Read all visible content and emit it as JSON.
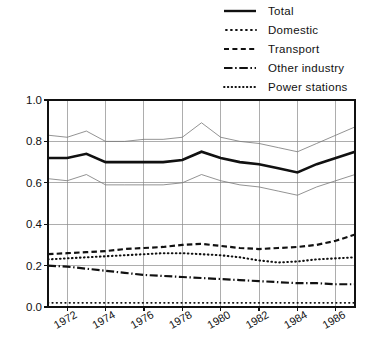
{
  "chart_data": {
    "type": "line",
    "title": "",
    "subtitle": "",
    "xlabel": "",
    "ylabel": "",
    "xlim": [
      1971,
      1987
    ],
    "ylim": [
      0.0,
      1.0
    ],
    "grid": true,
    "legend_position": "top-right",
    "x": [
      1971,
      1972,
      1973,
      1974,
      1975,
      1976,
      1977,
      1978,
      1979,
      1980,
      1981,
      1982,
      1983,
      1984,
      1985,
      1986,
      1987
    ],
    "y_ticks": [
      0.0,
      0.2,
      0.4,
      0.6,
      0.8,
      1.0
    ],
    "y_tick_labels": [
      "0.0",
      "0.2",
      "0.4",
      "0.6",
      "0.8",
      "1.0"
    ],
    "x_ticks": [
      1972,
      1974,
      1976,
      1978,
      1980,
      1982,
      1984,
      1986
    ],
    "x_tick_labels": [
      "1972",
      "1974",
      "1976",
      "1978",
      "1980",
      "1982",
      "1984",
      "1986"
    ],
    "series": [
      {
        "name": "Total",
        "style": "solid",
        "values": [
          0.72,
          0.72,
          0.74,
          0.7,
          0.7,
          0.7,
          0.7,
          0.71,
          0.75,
          0.72,
          0.7,
          0.69,
          0.67,
          0.65,
          0.69,
          0.72,
          0.75
        ]
      },
      {
        "name": "Total upper bound",
        "style": "thin-solid",
        "values": [
          0.83,
          0.82,
          0.85,
          0.8,
          0.8,
          0.81,
          0.81,
          0.82,
          0.89,
          0.82,
          0.8,
          0.79,
          0.77,
          0.75,
          0.79,
          0.83,
          0.87
        ]
      },
      {
        "name": "Total lower bound",
        "style": "thin-solid",
        "values": [
          0.62,
          0.61,
          0.64,
          0.59,
          0.59,
          0.59,
          0.59,
          0.6,
          0.64,
          0.61,
          0.59,
          0.58,
          0.56,
          0.54,
          0.58,
          0.61,
          0.64
        ]
      },
      {
        "name": "Domestic",
        "style": "dotted",
        "values": [
          0.23,
          0.235,
          0.24,
          0.245,
          0.25,
          0.255,
          0.26,
          0.26,
          0.255,
          0.25,
          0.24,
          0.225,
          0.215,
          0.22,
          0.23,
          0.235,
          0.24
        ]
      },
      {
        "name": "Transport",
        "style": "dashed",
        "values": [
          0.255,
          0.26,
          0.265,
          0.27,
          0.28,
          0.285,
          0.29,
          0.3,
          0.305,
          0.295,
          0.285,
          0.28,
          0.285,
          0.29,
          0.3,
          0.32,
          0.35
        ]
      },
      {
        "name": "Other industry",
        "style": "dash-dot",
        "values": [
          0.2,
          0.195,
          0.185,
          0.175,
          0.165,
          0.155,
          0.15,
          0.145,
          0.14,
          0.135,
          0.13,
          0.125,
          0.12,
          0.115,
          0.115,
          0.11,
          0.11
        ]
      },
      {
        "name": "Power stations",
        "style": "fine-dotted",
        "values": [
          0.02,
          0.02,
          0.02,
          0.02,
          0.02,
          0.02,
          0.02,
          0.02,
          0.02,
          0.02,
          0.02,
          0.02,
          0.02,
          0.02,
          0.02,
          0.02,
          0.02
        ]
      }
    ],
    "legend_entries": [
      {
        "label": "Total",
        "style": "solid"
      },
      {
        "label": "Domestic",
        "style": "dotted"
      },
      {
        "label": "Transport",
        "style": "dashed"
      },
      {
        "label": "Other industry",
        "style": "dash-dot"
      },
      {
        "label": "Power stations",
        "style": "fine-dotted"
      }
    ]
  },
  "legend": {
    "total": "Total",
    "domestic": "Domestic",
    "transport": "Transport",
    "other_industry": "Other industry",
    "power_stations": "Power stations"
  },
  "axis": {
    "y_labels": [
      "1.0",
      "0.8",
      "0.6",
      "0.4",
      "0.2",
      "0.0"
    ],
    "x_labels": [
      "1972",
      "1974",
      "1976",
      "1978",
      "1980",
      "1982",
      "1984",
      "1986"
    ]
  }
}
